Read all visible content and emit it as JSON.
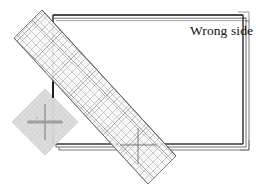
{
  "figure": {
    "kind": "sewing-instruction-illustration",
    "background_color": "#ffffff"
  },
  "labels": {
    "wrong_side": "Wrong side",
    "ruler_small_print": "45°"
  },
  "fabric": {
    "name": "folded fabric piece",
    "fill_color": "#ffffff",
    "edge_color": "#3a3a3a",
    "rect": {
      "x": 53,
      "y": 15,
      "width": 190,
      "height": 129
    },
    "layer_offsets": [
      3,
      6
    ],
    "top_fold_lines": 3
  },
  "bias_triangle": {
    "name": "bias fold shading",
    "fill_color": "#d9d9d9",
    "stroke_color": "#bdbdbd",
    "center": {
      "x": 45,
      "y": 122
    },
    "half_diagonal": 33
  },
  "ruler": {
    "name": "transparent gridded ruler",
    "angle_degrees": -45,
    "body_fill": "#fbfbfb",
    "body_stroke": "#7d7d7d",
    "grid_color": "#9a9a9a",
    "grid_spacing_px": 9,
    "corners": [
      {
        "x": 14,
        "y": 38
      },
      {
        "x": 42,
        "y": 10
      },
      {
        "x": 176,
        "y": 156
      },
      {
        "x": 148,
        "y": 184
      }
    ],
    "crosshairs": [
      {
        "x": 45,
        "y": 122
      },
      {
        "x": 138,
        "y": 145
      }
    ]
  },
  "colors": {
    "ink": "#111111",
    "line": "#3a3a3a",
    "grid": "#9a9a9a",
    "shade": "#d9d9d9"
  }
}
